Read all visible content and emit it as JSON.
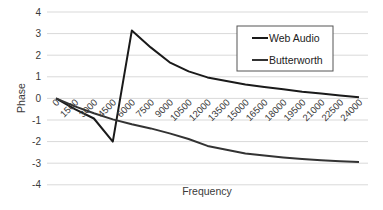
{
  "chart_data": {
    "type": "line",
    "title": "",
    "xlabel": "Frequency",
    "ylabel": "Phase",
    "ylim": [
      -4,
      4
    ],
    "yticks": [
      4,
      3,
      2,
      1,
      0,
      -1,
      -2,
      -3,
      -4
    ],
    "grid": true,
    "legend_position": "upper right (inside)",
    "categories": [
      "0",
      "1500",
      "3000",
      "4500",
      "6000",
      "7500",
      "9000",
      "10500",
      "12000",
      "13500",
      "15000",
      "16500",
      "18000",
      "19500",
      "21000",
      "22500",
      "24000"
    ],
    "series": [
      {
        "name": "Web Audio",
        "color": "#1a1a1a",
        "values": [
          0,
          -0.5,
          -0.93,
          -2.0,
          3.14,
          2.36,
          1.67,
          1.25,
          0.97,
          0.8,
          0.65,
          0.53,
          0.42,
          0.31,
          0.22,
          0.13,
          0.05
        ]
      },
      {
        "name": "Butterworth",
        "color": "#333333",
        "values": [
          0,
          -0.37,
          -0.69,
          -0.97,
          -1.2,
          -1.39,
          -1.62,
          -1.88,
          -2.2,
          -2.38,
          -2.55,
          -2.65,
          -2.73,
          -2.8,
          -2.86,
          -2.91,
          -2.95
        ]
      }
    ]
  },
  "legend": {
    "items": [
      {
        "label": "Web Audio"
      },
      {
        "label": "Butterworth"
      }
    ]
  },
  "axes": {
    "x_title": "Frequency",
    "y_title": "Phase"
  }
}
